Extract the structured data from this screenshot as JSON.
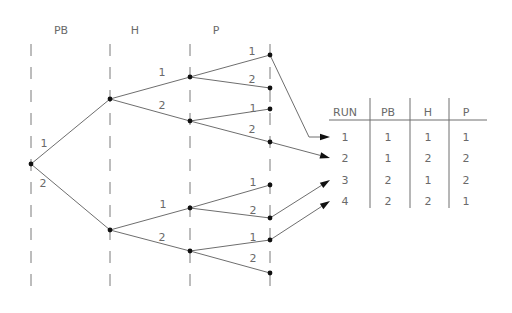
{
  "diagram": {
    "type": "factorial-tree",
    "factor_headers": [
      {
        "label": "PB",
        "x": 61
      },
      {
        "label": "H",
        "x": 135
      },
      {
        "label": "P",
        "x": 216
      }
    ],
    "levels_x": [
      31,
      110,
      190,
      270
    ],
    "nodes": [
      {
        "id": "root",
        "x": 31,
        "y": 164
      },
      {
        "id": "pb1",
        "x": 110,
        "y": 99
      },
      {
        "id": "pb2",
        "x": 110,
        "y": 230
      },
      {
        "id": "pb1h1",
        "x": 190,
        "y": 77
      },
      {
        "id": "pb1h2",
        "x": 190,
        "y": 121
      },
      {
        "id": "pb2h1",
        "x": 190,
        "y": 208
      },
      {
        "id": "pb2h2",
        "x": 190,
        "y": 251
      },
      {
        "id": "pb1h1p1",
        "x": 270,
        "y": 55
      },
      {
        "id": "pb1h1p2",
        "x": 270,
        "y": 88
      },
      {
        "id": "pb1h2p1",
        "x": 270,
        "y": 109
      },
      {
        "id": "pb1h2p2",
        "x": 270,
        "y": 142
      },
      {
        "id": "pb2h1p1",
        "x": 270,
        "y": 185
      },
      {
        "id": "pb2h1p2",
        "x": 270,
        "y": 218
      },
      {
        "id": "pb2h2p1",
        "x": 270,
        "y": 240
      },
      {
        "id": "pb2h2p2",
        "x": 270,
        "y": 273
      }
    ],
    "edges": [
      {
        "from": "root",
        "to": "pb1",
        "label": "1",
        "lx": 44,
        "ly": 147
      },
      {
        "from": "root",
        "to": "pb2",
        "label": "2",
        "lx": 43,
        "ly": 187
      },
      {
        "from": "pb1",
        "to": "pb1h1",
        "label": "1",
        "lx": 162,
        "ly": 76
      },
      {
        "from": "pb1",
        "to": "pb1h2",
        "label": "2",
        "lx": 162,
        "ly": 109
      },
      {
        "from": "pb2",
        "to": "pb2h1",
        "label": "1",
        "lx": 163,
        "ly": 208
      },
      {
        "from": "pb2",
        "to": "pb2h2",
        "label": "2",
        "lx": 162,
        "ly": 241
      },
      {
        "from": "pb1h1",
        "to": "pb1h1p1",
        "label": "1",
        "lx": 252,
        "ly": 55
      },
      {
        "from": "pb1h1",
        "to": "pb1h1p2",
        "label": "2",
        "lx": 252,
        "ly": 83
      },
      {
        "from": "pb1h2",
        "to": "pb1h2p1",
        "label": "1",
        "lx": 253,
        "ly": 112
      },
      {
        "from": "pb1h2",
        "to": "pb1h2p2",
        "label": "2",
        "lx": 252,
        "ly": 133
      },
      {
        "from": "pb2h1",
        "to": "pb2h1p1",
        "label": "1",
        "lx": 253,
        "ly": 186
      },
      {
        "from": "pb2h1",
        "to": "pb2h1p2",
        "label": "2",
        "lx": 253,
        "ly": 214
      },
      {
        "from": "pb2h2",
        "to": "pb2h2p1",
        "label": "1",
        "lx": 253,
        "ly": 241
      },
      {
        "from": "pb2h2",
        "to": "pb2h2p2",
        "label": "2",
        "lx": 253,
        "ly": 262
      }
    ],
    "arrows": [
      {
        "run": "1",
        "points": [
          [
            270,
            55
          ],
          [
            309,
            137
          ],
          [
            330,
            137
          ]
        ]
      },
      {
        "run": "2",
        "points": [
          [
            270,
            142
          ],
          [
            330,
            158
          ]
        ]
      },
      {
        "run": "3",
        "points": [
          [
            270,
            218
          ],
          [
            330,
            180
          ]
        ]
      },
      {
        "run": "4",
        "points": [
          [
            270,
            240
          ],
          [
            330,
            201
          ]
        ]
      }
    ]
  },
  "table": {
    "columns": [
      "RUN",
      "PB",
      "H",
      "P"
    ],
    "column_x": [
      345,
      388,
      428,
      466
    ],
    "header_y": 116,
    "row_y": [
      141,
      162,
      184,
      205
    ],
    "rows": [
      {
        "RUN": "1",
        "PB": "1",
        "H": "1",
        "P": "1"
      },
      {
        "RUN": "2",
        "PB": "1",
        "H": "2",
        "P": "2"
      },
      {
        "RUN": "3",
        "PB": "2",
        "H": "1",
        "P": "2"
      },
      {
        "RUN": "4",
        "PB": "2",
        "H": "2",
        "P": "1"
      }
    ]
  }
}
